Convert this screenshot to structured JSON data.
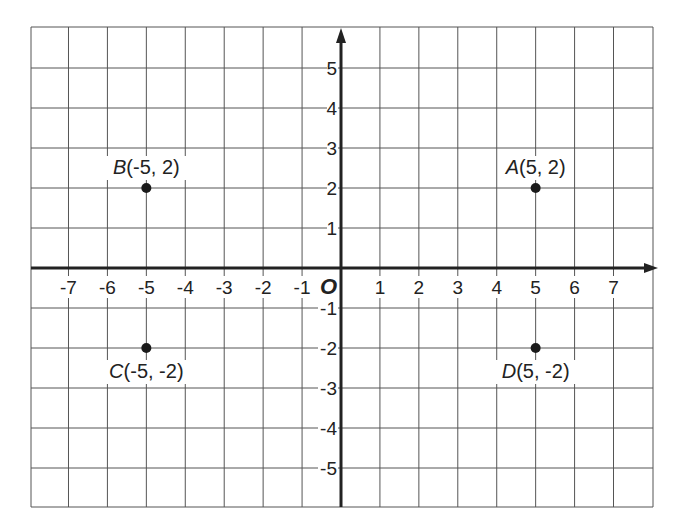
{
  "diagram": {
    "type": "coordinate-plane",
    "origin_label": "O",
    "x_range": [
      -8,
      8
    ],
    "y_range": [
      -6,
      6
    ],
    "grid": true,
    "x_ticks": [
      "-7",
      "-6",
      "-5",
      "-4",
      "-3",
      "-2",
      "-1",
      "1",
      "2",
      "3",
      "4",
      "5",
      "6",
      "7"
    ],
    "y_ticks": [
      "5",
      "4",
      "3",
      "2",
      "1",
      "-1",
      "-2",
      "-3",
      "-4",
      "-5"
    ],
    "points": [
      {
        "name": "A",
        "coords": "(5, 2)",
        "x": 5,
        "y": 2
      },
      {
        "name": "B",
        "coords": "(-5, 2)",
        "x": -5,
        "y": 2
      },
      {
        "name": "C",
        "coords": "(-5, -2)",
        "x": -5,
        "y": -2
      },
      {
        "name": "D",
        "coords": "(5, -2)",
        "x": 5,
        "y": -2
      }
    ],
    "colors": {
      "grid": "#555555",
      "axis": "#222222",
      "point": "#1a1a1a",
      "text": "#222222"
    }
  }
}
